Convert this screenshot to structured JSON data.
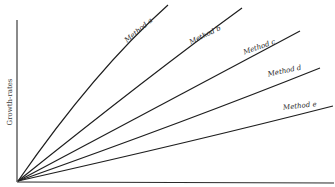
{
  "chart_data": {
    "type": "line",
    "title": "",
    "xlabel": "",
    "ylabel": "Growth-rates",
    "grid": false,
    "axis_ticks": false,
    "legend": "inline-labels",
    "series": [
      {
        "name": "Method a",
        "shape": "concave",
        "relative_end_value": 1.0
      },
      {
        "name": "Method b",
        "shape": "slightly-concave",
        "relative_end_value": 0.98
      },
      {
        "name": "Method c",
        "shape": "slightly-concave",
        "relative_end_value": 0.84
      },
      {
        "name": "Method d",
        "shape": "slightly-concave",
        "relative_end_value": 0.64
      },
      {
        "name": "Method e",
        "shape": "concave",
        "relative_end_value": 0.43
      }
    ]
  }
}
